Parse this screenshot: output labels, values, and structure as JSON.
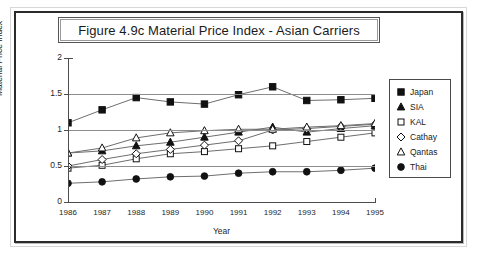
{
  "figure": {
    "title": "Figure 4.9c  Material Price Index - Asian Carriers"
  },
  "axes": {
    "ylabel": "Material Price Index",
    "xlabel": "Year",
    "yticks": [
      "0",
      "0.5",
      "1",
      "1.5",
      "2"
    ],
    "xticks": [
      "1986",
      "1987",
      "1988",
      "1989",
      "1990",
      "1991",
      "1992",
      "1993",
      "1994",
      "1995"
    ]
  },
  "legend": {
    "entries": [
      {
        "label": "Japan",
        "marker": "filled-square"
      },
      {
        "label": "SIA",
        "marker": "filled-triangle"
      },
      {
        "label": "KAL",
        "marker": "open-square"
      },
      {
        "label": "Cathay",
        "marker": "open-diamond"
      },
      {
        "label": "Qantas",
        "marker": "open-triangle"
      },
      {
        "label": "Thai",
        "marker": "filled-circle"
      }
    ]
  },
  "colors": {
    "line": "#6e6e6e",
    "marker_stroke": "#111111",
    "marker_fill": "#111111",
    "grid": "#8d8d8d",
    "axis": "#4d4d4d",
    "frame": "#2b2b2b"
  },
  "chart_data": {
    "type": "line",
    "title": "Figure 4.9c  Material Price Index - Asian Carriers",
    "xlabel": "Year",
    "ylabel": "Material Price Index",
    "x": [
      1986,
      1987,
      1988,
      1989,
      1990,
      1991,
      1992,
      1993,
      1994,
      1995
    ],
    "categories": [
      "1986",
      "1987",
      "1988",
      "1989",
      "1990",
      "1991",
      "1992",
      "1993",
      "1994",
      "1995"
    ],
    "xlim": [
      1986,
      1995
    ],
    "ylim": [
      0,
      2
    ],
    "yticks": [
      0,
      0.5,
      1,
      1.5,
      2
    ],
    "grid": true,
    "legend_position": "right",
    "series": [
      {
        "name": "Japan",
        "marker": "filled-square",
        "values": [
          1.1,
          1.28,
          1.45,
          1.39,
          1.36,
          1.49,
          1.6,
          1.41,
          1.42,
          1.44
        ]
      },
      {
        "name": "SIA",
        "marker": "filled-triangle",
        "values": [
          0.68,
          0.71,
          0.78,
          0.83,
          0.9,
          0.97,
          1.04,
          0.97,
          1.02,
          1.06
        ]
      },
      {
        "name": "KAL",
        "marker": "open-square",
        "values": [
          0.47,
          0.51,
          0.6,
          0.67,
          0.7,
          0.74,
          0.78,
          0.84,
          0.9,
          0.96
        ]
      },
      {
        "name": "Cathay",
        "marker": "open-diamond",
        "values": [
          0.5,
          0.59,
          0.67,
          0.73,
          0.79,
          0.85,
          1.0,
          1.02,
          1.05,
          1.08
        ]
      },
      {
        "name": "Qantas",
        "marker": "open-triangle",
        "values": [
          0.68,
          0.75,
          0.89,
          0.96,
          0.99,
          1.01,
          1.01,
          1.04,
          1.06,
          1.09
        ]
      },
      {
        "name": "Thai",
        "marker": "filled-circle",
        "values": [
          0.26,
          0.28,
          0.32,
          0.35,
          0.36,
          0.4,
          0.42,
          0.42,
          0.44,
          0.47
        ]
      }
    ]
  }
}
